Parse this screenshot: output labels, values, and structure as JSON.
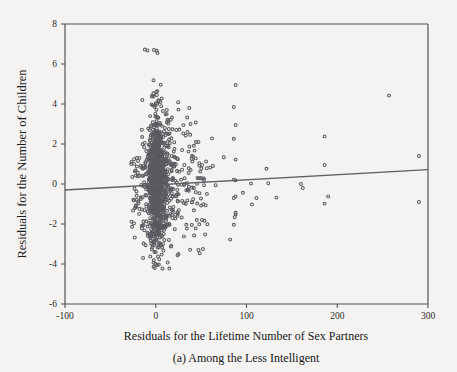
{
  "figure": {
    "caption": "(a) Among the Less Intelligent",
    "background_color": "#f5f3f1",
    "ink_color": "#53535a",
    "marker_color": "#5a5a60",
    "line_color": "#5e5e66"
  },
  "chart_data": {
    "type": "scatter",
    "title": "",
    "xlabel": "Residuals for the Lifetime Number of Sex Partners",
    "ylabel": "Residuals for the Number of Children",
    "annotation": "(a) Among the Less Intelligent",
    "xlim": [
      -100,
      300
    ],
    "ylim": [
      -6,
      8
    ],
    "xticks": [
      -100,
      0,
      100,
      200,
      300
    ],
    "xtick_labels": [
      "-100",
      "0",
      "100",
      "200",
      "300"
    ],
    "yticks": [
      -6,
      -4,
      -2,
      0,
      2,
      4,
      6,
      8
    ],
    "ytick_labels": [
      "-6",
      "-4",
      "-2",
      "0",
      "2",
      "4",
      "6",
      "8"
    ],
    "grid": false,
    "legend": null,
    "marker": "open-circle",
    "marker_size": 3,
    "trendline": {
      "type": "linear-fit",
      "x_start": -100,
      "y_start": -0.3,
      "x_end": 300,
      "y_end": 0.72,
      "slope": 0.00255,
      "intercept": -0.045
    },
    "series": [
      {
        "name": "residual pairs",
        "n_points": 1260,
        "description": "Dense vertical cluster centered near x=0 spanning y=-4.3..5.5, with sparse high-x outliers out to x=290.",
        "outliers": [
          [
            -12,
            6.72
          ],
          [
            -9,
            6.68
          ],
          [
            -2,
            6.7
          ],
          [
            1,
            6.66
          ],
          [
            2,
            6.55
          ],
          [
            88,
            4.95
          ],
          [
            257,
            4.42
          ],
          [
            86,
            3.85
          ],
          [
            37,
            3.8
          ],
          [
            25,
            3.72
          ],
          [
            88,
            2.95
          ],
          [
            186,
            2.38
          ],
          [
            62,
            2.28
          ],
          [
            86,
            2.26
          ],
          [
            44,
            3.08
          ],
          [
            33,
            2.42
          ],
          [
            88,
            1.22
          ],
          [
            75,
            1.34
          ],
          [
            40,
            1.42
          ],
          [
            290,
            1.4
          ],
          [
            122,
            0.76
          ],
          [
            186,
            0.95
          ],
          [
            60,
            0.82
          ],
          [
            63,
            0.9
          ],
          [
            46,
            0.3
          ],
          [
            105,
            0.02
          ],
          [
            124,
            0.04
          ],
          [
            160,
            0.0
          ],
          [
            162,
            -0.2
          ],
          [
            88,
            0.18
          ],
          [
            86,
            0.22
          ],
          [
            66,
            -0.06
          ],
          [
            88,
            -0.62
          ],
          [
            96,
            -0.44
          ],
          [
            133,
            -0.68
          ],
          [
            111,
            -0.7
          ],
          [
            190,
            -0.62
          ],
          [
            86,
            -0.7
          ],
          [
            106,
            -1.02
          ],
          [
            186,
            -0.98
          ],
          [
            290,
            -0.9
          ],
          [
            88,
            -1.52
          ],
          [
            87,
            -1.66
          ],
          [
            88,
            -1.44
          ],
          [
            86,
            -2.04
          ],
          [
            82,
            -2.78
          ],
          [
            51,
            -1.8
          ],
          [
            44,
            -2.22
          ],
          [
            47,
            -3.3
          ],
          [
            31,
            -2.62
          ],
          [
            24,
            -3.56
          ],
          [
            -14,
            -3.7
          ],
          [
            -22,
            0.42
          ],
          [
            -20,
            0.38
          ],
          [
            -24,
            -0.82
          ],
          [
            -21,
            -0.8
          ],
          [
            -25,
            -1.32
          ],
          [
            -26,
            -2.14
          ],
          [
            -24,
            -1.96
          ],
          [
            53,
            0.28
          ],
          [
            55,
            -1.06
          ],
          [
            50,
            -1.08
          ],
          [
            29,
            1.7
          ],
          [
            36,
            1.62
          ],
          [
            41,
            1.36
          ],
          [
            44,
            1.28
          ],
          [
            48,
            0.92
          ],
          [
            49,
            0.62
          ],
          [
            35,
            2.6
          ],
          [
            38,
            2.46
          ]
        ]
      }
    ]
  }
}
